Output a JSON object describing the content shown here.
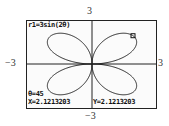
{
  "axis_labels": {
    "ymax": "3",
    "ymin": "−3",
    "xmin": "−3",
    "xmax": "3"
  },
  "screen": {
    "equation": "r1=3sin(2θ)",
    "theta_readout": "θ=45",
    "x_readout": "X=2.1213203",
    "y_readout": "Y=2.1213203"
  },
  "colors": {
    "curve": "#222222",
    "axes": "#222222",
    "background": "#fbfbfb"
  },
  "chart_data": {
    "type": "line",
    "title": "r1=3sin(2θ)",
    "coordinate_system": "polar",
    "equation": "r = 3 sin(2θ)",
    "xlabel": "",
    "ylabel": "",
    "xlim": [
      -3,
      3
    ],
    "ylim": [
      -3,
      3
    ],
    "tick_labels": {
      "x": [
        "−3",
        "3"
      ],
      "y": [
        "−3",
        "3"
      ]
    },
    "grid": false,
    "trace_cursor": {
      "theta_deg": 45,
      "x": 2.1213203,
      "y": 2.1213203
    },
    "series": [
      {
        "name": "r1",
        "description": "four-petal rose",
        "points_xy": [
          [
            0,
            0
          ],
          [
            0.46,
            0.12
          ],
          [
            0.87,
            0.5
          ],
          [
            1.2,
            0.97
          ],
          [
            1.5,
            1.5
          ],
          [
            1.82,
            2.06
          ],
          [
            2.12,
            2.12
          ],
          [
            2.06,
            1.82
          ],
          [
            1.5,
            1.5
          ],
          [
            0.97,
            1.2
          ],
          [
            0.5,
            0.87
          ],
          [
            0.12,
            0.46
          ],
          [
            0,
            0
          ]
        ]
      }
    ]
  }
}
